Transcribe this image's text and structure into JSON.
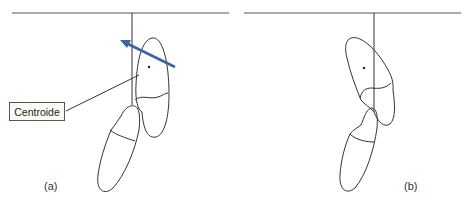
{
  "figure": {
    "panels": [
      {
        "id": "a",
        "label": "(a)"
      },
      {
        "id": "b",
        "label": "(b)"
      }
    ],
    "callout": {
      "text": "Centroide"
    },
    "colors": {
      "line": "#333333",
      "arrow": "#3A64A8",
      "callout_bg": "#fbfbf4"
    }
  }
}
